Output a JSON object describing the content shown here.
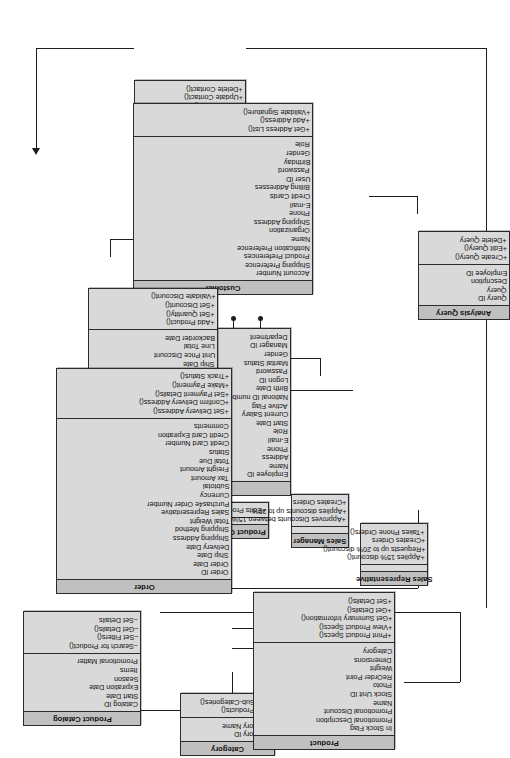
{
  "diagram": {
    "orientation": "rotated-90-ccw",
    "colors": {
      "class_header": "#c0c0c0",
      "class_body": "#d9d9d9",
      "border": "#2b2b2b",
      "connector": "#1d1d1d",
      "background": "#ffffff"
    }
  },
  "classes": {
    "party": {
      "name": "Party",
      "attributes": [],
      "operations": [
        "+Creat an Account()",
        "+Delete an Account()",
        "+Update an Account()"
      ]
    },
    "organization": {
      "name": "Organization",
      "attributes": [
        "Name",
        "Address",
        "Phone",
        "Primary Contact",
        "Status",
        "Comments"
      ],
      "operations": [
        "+Add Contact()",
        "+Update Contact()",
        "+Delete Contact()"
      ]
    },
    "customer": {
      "name": "Customer",
      "attributes": [
        "Account Number",
        "Shipping Preference",
        "Product Preferences",
        "Notification Preference",
        "Name",
        "Organization",
        "Shipping Address",
        "Phone",
        "E-mail",
        "Credit Cards",
        "Billing Addresses",
        "User ID",
        "Password",
        "Birthday",
        "Gender",
        "Role"
      ],
      "operations": [
        "+Get Address List()",
        "+Add Address()",
        "+Validate Signature()"
      ]
    },
    "employee": {
      "name": "Employee",
      "attributes": [
        "Employee ID",
        "Name",
        "Address",
        "Phone",
        "E-mail",
        "Role",
        "Start Date",
        "Current Salary",
        "Active Flag",
        "National ID number",
        "Birth Date",
        "Logon ID",
        "Password",
        "Marital Status",
        "Gender",
        "Manager ID",
        "Department"
      ],
      "operations": []
    },
    "analysis_query": {
      "name": "Analysis Query",
      "attributes": [
        "Query ID",
        "Query",
        "Description",
        "Employee ID"
      ],
      "operations": [
        "+Create Query()",
        "+Edit Query()",
        "+Delete Query"
      ]
    },
    "order_line_item": {
      "name": "Order Line Item",
      "attributes": [
        "Product ID",
        "Quantity",
        "Unit Price",
        "Ship Date",
        "Unit Price Discount",
        "Line Total",
        "Backorder Date"
      ],
      "operations": [
        "+Add Product()",
        "+Set Quantity()",
        "+Set Discount()",
        "+Validate Discount()"
      ]
    },
    "product_clerk": {
      "name": "Product Clerk",
      "attributes": [],
      "operations": [
        "+Edits Product Data()"
      ]
    },
    "sales_manager": {
      "name": "Sales Manager",
      "attributes": [],
      "operations": [
        "+Approves Discounts between 15% to 20%()",
        "+Applies discounts up to 20%",
        "+Creates Orders"
      ]
    },
    "sales_representative": {
      "name": "Sales Representative",
      "attributes": [],
      "operations": [
        "+Applies 15% discount()",
        "+Requests up to 20% discount()",
        "+Creates Orders",
        "+Takes Phone Orders()"
      ]
    },
    "order": {
      "name": "Order",
      "attributes": [
        "Order ID",
        "Order Date",
        "Ship Date",
        "Delivery Date",
        "Shipping Address",
        "Shipping Method",
        "Total Weight",
        "Sales Representative",
        "Purchas4e Order Number",
        "Currency",
        "Subtotal",
        "Tax Amount",
        "Freight Amount",
        "Total Due",
        "Status",
        "Credit Card Number",
        "Credit Card Expiration",
        "Comments"
      ],
      "operations": [
        "+Set Delivery Address()",
        "+Confirm Delivery Address()",
        "+Set Payment Details()",
        "+Make Payment()",
        "+Track Status()"
      ]
    },
    "product_catalog": {
      "name": "Product Catalog",
      "attributes": [
        "Catalog ID",
        "Start Date",
        "Expiration Date",
        "Season",
        "Items",
        "Promotional Matter"
      ],
      "operations": [
        "–Search for Product()",
        "–Set Filters()",
        "–Get Details()",
        "–Set Details"
      ]
    },
    "category": {
      "name": "Category",
      "attributes": [
        "Category ID",
        "Category Name"
      ],
      "operations": [
        "+List Products()",
        "+List Sub-Categories()"
      ]
    },
    "product": {
      "name": "Product",
      "attributes": [
        "In Stock Flag",
        "Promotional Description",
        "Promotional Discount",
        "Name",
        "Stock Unit ID",
        "Photo",
        "ReOrder Point",
        "Weight",
        "Dimensions",
        "Category"
      ],
      "operations": [
        "+Print Product Specs()",
        "+View Product Specs()",
        "+Get Summary Information()",
        "+Get Details()",
        "+Set Details()"
      ]
    }
  }
}
